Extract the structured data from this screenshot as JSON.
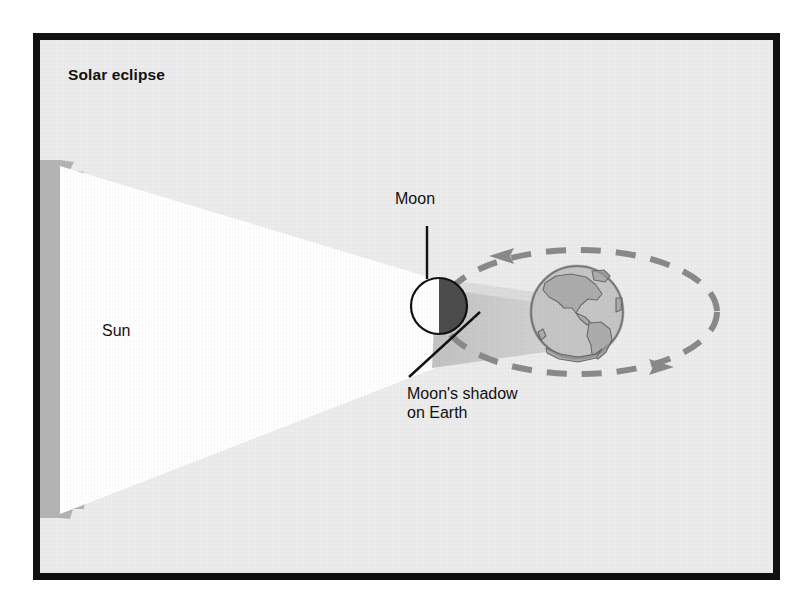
{
  "figure": {
    "title": "Solar eclipse",
    "type": "astronomy-diagram"
  },
  "labels": {
    "sun": "Sun",
    "moon": "Moon",
    "shadow": "Moon's shadow\non Earth"
  },
  "colors": {
    "frame": "#111111",
    "panel_background": "#ececec",
    "sun_fill": "#b4b4b4",
    "light_cone": "#ffffff",
    "moon_lit": "#ffffff",
    "moon_dark": "#4c4c4c",
    "moon_outline": "#111111",
    "shadow_cone": "#d2d2d2",
    "earth_ocean": "#c6c6c6",
    "earth_land": "#a6a6a6",
    "earth_outline": "#6b6b6b",
    "orbit_dash": "#8a8a8a",
    "leader_line": "#111111",
    "text": "#111111"
  },
  "elements": {
    "sun": {
      "name": "Sun",
      "shape": "spiky-circle",
      "center_x": 55,
      "center_y": 310,
      "radius": 155,
      "clipped_left": true
    },
    "light_cone": {
      "name": "Sunlight cone",
      "description": "White converging beam from Sun to Moon"
    },
    "moon": {
      "name": "Moon",
      "center_x": 432,
      "center_y": 299,
      "radius": 28,
      "lit_side": "left",
      "dark_side": "right"
    },
    "shadow_cone": {
      "name": "Moon's shadow on Earth",
      "description": "Tapering gray umbra from Moon toward Earth"
    },
    "earth": {
      "name": "Earth",
      "center_x": 570,
      "center_y": 305,
      "radius": 46,
      "continents": [
        "North America",
        "South America",
        "Greenland",
        "Antarctica"
      ]
    },
    "orbit": {
      "name": "Moon's orbit around Earth",
      "style": "dashed-ellipse",
      "center_x": 572,
      "center_y": 305,
      "radius_x": 138,
      "radius_y": 62,
      "arrow_top_direction": "left",
      "arrow_bottom_direction": "right"
    }
  },
  "leader_lines": [
    {
      "name": "moon-leader",
      "from_label": "Moon",
      "orientation": "vertical"
    },
    {
      "name": "shadow-leader",
      "from_label": "Moon's shadow on Earth",
      "orientation": "diagonal"
    }
  ]
}
